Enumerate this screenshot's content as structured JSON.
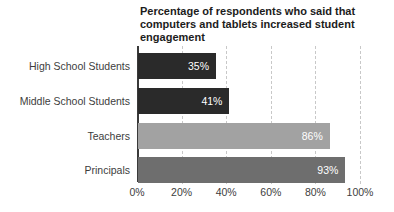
{
  "chart_data": {
    "type": "bar",
    "orientation": "horizontal",
    "title": "Percentage of respondents who said that computers and tablets increased student engagement",
    "categories": [
      "High School Students",
      "Middle School Students",
      "Teachers",
      "Principals"
    ],
    "values": [
      35,
      41,
      86,
      93
    ],
    "value_labels": [
      "35%",
      "41%",
      "86%",
      "93%"
    ],
    "bar_colors": [
      "#2a2a2a",
      "#2a2a2a",
      "#a2a2a2",
      "#6e6e6e"
    ],
    "xlabel": "",
    "ylabel": "",
    "xlim": [
      0,
      100
    ],
    "x_ticks": [
      "0%",
      "20%",
      "40%",
      "60%",
      "80%",
      "100%"
    ],
    "x_tick_values": [
      0,
      20,
      40,
      60,
      80,
      100
    ],
    "grid": "dashed-vertical-gridlines",
    "legend": "none",
    "value_label_color": "#ffffff",
    "axis_line_color": "#3a3a3a",
    "gridline_color": "#c8c8c8",
    "tick_label_color": "#3d3d3d",
    "category_label_color": "#3d3d3d",
    "title_color": "#1c1c1c"
  }
}
